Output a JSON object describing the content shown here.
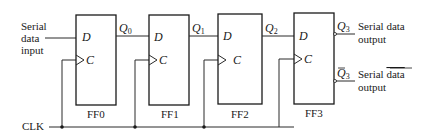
{
  "diagram": {
    "type": "serial-in serial-out shift register",
    "input": {
      "label_lines": [
        "Serial",
        "data",
        "input"
      ]
    },
    "clock": {
      "label": "CLK"
    },
    "flip_flops": [
      {
        "name": "FF0",
        "d_pin": "D",
        "c_pin": "C",
        "q_label": "Q",
        "q_sub": "0"
      },
      {
        "name": "FF1",
        "d_pin": "D",
        "c_pin": "C",
        "q_label": "Q",
        "q_sub": "1"
      },
      {
        "name": "FF2",
        "d_pin": "D",
        "c_pin": "C",
        "q_label": "Q",
        "q_sub": "2"
      },
      {
        "name": "FF3",
        "d_pin": "D",
        "c_pin": "C",
        "q_label": "Q",
        "q_sub": "3",
        "qbar_label": "Q",
        "qbar_sub": "3"
      }
    ],
    "outputs": {
      "q": {
        "line1": "Serial data",
        "line2": "output"
      },
      "qbar": {
        "line1_prefix": "Serial ",
        "line1_overlined": "data",
        "line2": "output"
      }
    },
    "colors": {
      "line": "#1a1a1a",
      "background": "#ffffff"
    }
  }
}
